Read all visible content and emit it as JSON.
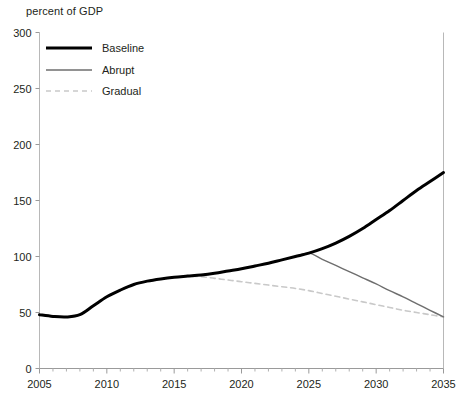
{
  "chart_data": {
    "type": "line",
    "title": "",
    "ylabel": "percent of GDP",
    "xlabel": "",
    "xlim": [
      2005,
      2035
    ],
    "ylim": [
      0,
      300
    ],
    "yticks": [
      0,
      50,
      100,
      150,
      200,
      250,
      300
    ],
    "xticks": [
      2005,
      2010,
      2015,
      2020,
      2025,
      2030,
      2035
    ],
    "minor_xtick_interval": 1,
    "grid": false,
    "legend_position": "top-left",
    "x": [
      2005,
      2006,
      2007,
      2008,
      2009,
      2010,
      2011,
      2012,
      2013,
      2014,
      2015,
      2016,
      2017,
      2018,
      2019,
      2020,
      2021,
      2022,
      2023,
      2024,
      2025,
      2026,
      2027,
      2028,
      2029,
      2030,
      2031,
      2032,
      2033,
      2034,
      2035
    ],
    "series": [
      {
        "name": "Baseline",
        "color": "#000000",
        "style": "solid",
        "width": 3,
        "values": [
          48,
          46.5,
          46,
          48,
          56,
          64,
          70,
          75,
          78,
          80,
          81.5,
          82.5,
          83.5,
          85,
          87,
          89,
          91.5,
          94,
          97,
          100,
          103,
          107,
          112,
          118,
          125,
          133,
          141,
          150,
          159,
          167,
          175
        ]
      },
      {
        "name": "Abrupt",
        "color": "#6e6e6e",
        "style": "solid",
        "width": 1.4,
        "values": [
          48,
          46.5,
          46,
          48,
          56,
          64,
          70,
          75,
          78,
          80,
          81.5,
          82.5,
          83.5,
          85,
          87,
          89,
          91.5,
          94,
          97,
          100,
          103,
          97.5,
          92,
          86.5,
          81,
          75.5,
          69.5,
          64,
          58,
          52,
          46
        ]
      },
      {
        "name": "Gradual",
        "color": "#c9c9c9",
        "style": "dashed",
        "width": 1.6,
        "values": [
          48,
          46.5,
          46,
          48,
          56,
          64,
          70,
          75,
          78,
          80,
          81.5,
          82,
          82,
          80.5,
          79,
          77.5,
          76,
          74.5,
          73,
          71.5,
          69.5,
          67,
          64.5,
          62,
          59.5,
          57,
          54.5,
          52,
          50,
          48,
          46
        ]
      }
    ]
  },
  "legend": {
    "items": [
      {
        "label": "Baseline"
      },
      {
        "label": "Abrupt"
      },
      {
        "label": "Gradual"
      }
    ]
  },
  "axes": {
    "y_tick_labels": [
      "300",
      "250",
      "200",
      "150",
      "100",
      "50",
      "0"
    ],
    "x_tick_labels": [
      "2005",
      "2010",
      "2015",
      "2020",
      "2025",
      "2030",
      "2035"
    ]
  }
}
